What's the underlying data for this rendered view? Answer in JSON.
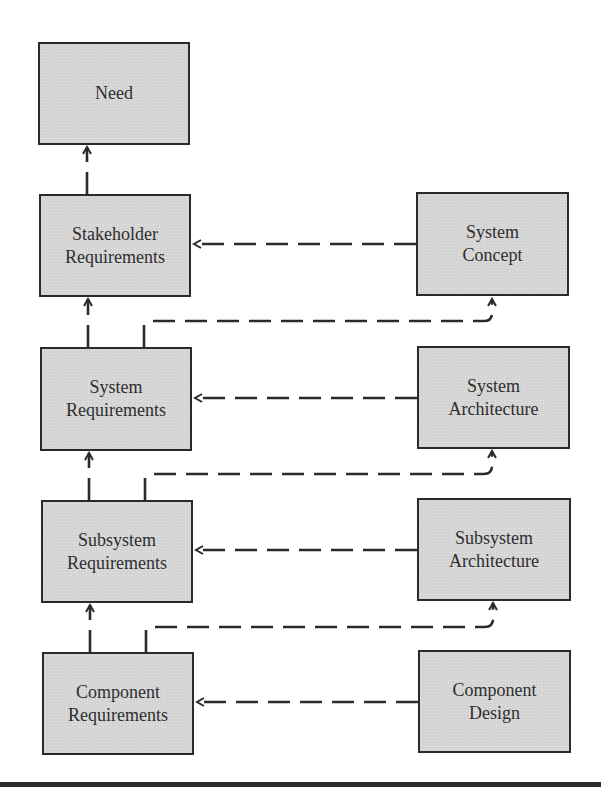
{
  "diagram": {
    "type": "requirements-traceability-flow",
    "colors": {
      "box_fill": "#d4d4d4",
      "box_border": "#2b2b2b",
      "line": "#2b2b2b",
      "text": "#2e2e2e",
      "background": "#ffffff"
    },
    "left_column": [
      {
        "id": "need",
        "label": "Need"
      },
      {
        "id": "stakeholder-requirements",
        "label": "Stakeholder\nRequirements"
      },
      {
        "id": "system-requirements",
        "label": "System\nRequirements"
      },
      {
        "id": "subsystem-requirements",
        "label": "Subsystem\nRequirements"
      },
      {
        "id": "component-requirements",
        "label": "Component\nRequirements"
      }
    ],
    "right_column": [
      {
        "id": "system-concept",
        "label": "System\nConcept"
      },
      {
        "id": "system-architecture",
        "label": "System\nArchitecture"
      },
      {
        "id": "subsystem-architecture",
        "label": "Subsystem\nArchitecture"
      },
      {
        "id": "component-design",
        "label": "Component\nDesign"
      }
    ],
    "edges": [
      {
        "from": "stakeholder-requirements",
        "to": "need",
        "style": "dashed",
        "arrow": "end"
      },
      {
        "from": "system-requirements",
        "to": "stakeholder-requirements",
        "style": "dashed",
        "arrow": "end"
      },
      {
        "from": "subsystem-requirements",
        "to": "system-requirements",
        "style": "dashed",
        "arrow": "end"
      },
      {
        "from": "component-requirements",
        "to": "subsystem-requirements",
        "style": "dashed",
        "arrow": "end"
      },
      {
        "from": "system-concept",
        "to": "stakeholder-requirements",
        "style": "dashed",
        "arrow": "end"
      },
      {
        "from": "system-architecture",
        "to": "system-requirements",
        "style": "dashed",
        "arrow": "end"
      },
      {
        "from": "subsystem-architecture",
        "to": "subsystem-requirements",
        "style": "dashed",
        "arrow": "end"
      },
      {
        "from": "component-design",
        "to": "component-requirements",
        "style": "dashed",
        "arrow": "end"
      },
      {
        "from": "system-requirements",
        "to": "system-concept",
        "style": "dashed",
        "arrow": "end"
      },
      {
        "from": "subsystem-requirements",
        "to": "system-architecture",
        "style": "dashed",
        "arrow": "end"
      },
      {
        "from": "component-requirements",
        "to": "subsystem-architecture",
        "style": "dashed",
        "arrow": "end"
      }
    ]
  }
}
